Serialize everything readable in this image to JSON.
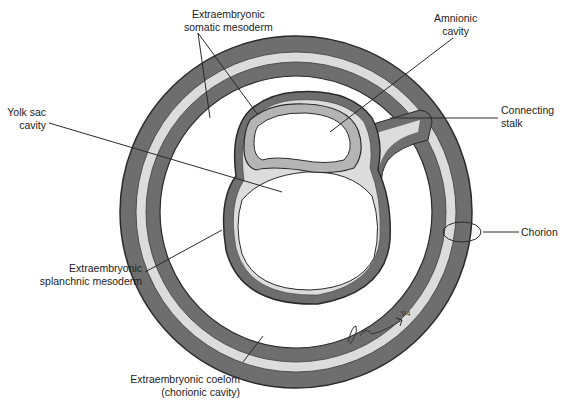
{
  "diagram": {
    "colors": {
      "dark_band": "#6e6e6e",
      "light_band": "#dcdcdc",
      "amnion_band": "#b4b4b4",
      "outline": "#2a2a2a",
      "background": "#ffffff"
    }
  },
  "labels": {
    "somatic_mesoderm": "Extraembryonic\nsomatic mesoderm",
    "amnionic_cavity": "Amnionic\ncavity",
    "yolk_sac_cavity": "Yolk sac\ncavity",
    "connecting_stalk": "Connecting\nstalk",
    "chorion": "Chorion",
    "splanchnic_mesoderm": "Extraembryonic\nsplanchnic mesoderm",
    "coelom": "Extraembryonic coelom\n(chorionic cavity)"
  },
  "signature": {
    "text": "J. Cummins",
    "year": "'94"
  }
}
